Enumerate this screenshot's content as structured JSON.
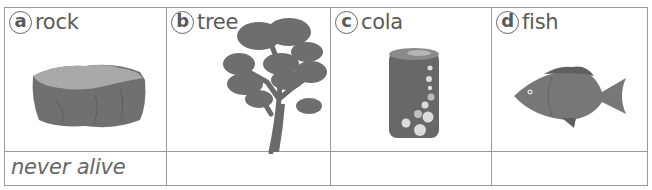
{
  "items": [
    {
      "letter": "a",
      "name": "rock",
      "image": "rock-illustration",
      "answer": "never alive"
    },
    {
      "letter": "b",
      "name": "tree",
      "image": "tree-illustration",
      "answer": ""
    },
    {
      "letter": "c",
      "name": "cola",
      "image": "cola-can-illustration",
      "answer": ""
    },
    {
      "letter": "d",
      "name": "fish",
      "image": "fish-illustration",
      "answer": ""
    }
  ],
  "colors": {
    "border": "#9a9a9a",
    "text": "#5a5a5a",
    "illustration_dark": "#6e6e6e",
    "illustration_light": "#a8a8a8"
  }
}
